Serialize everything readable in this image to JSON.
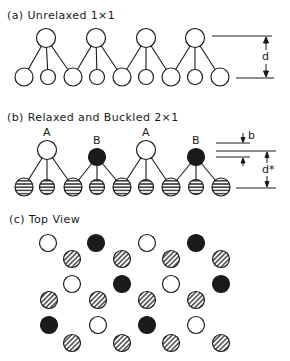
{
  "panels": {
    "a": {
      "title": "(a)  Unrelaxed  1×1",
      "dim_label": "d"
    },
    "b": {
      "title": "(b)  Relaxed and Buckled  2×1",
      "atom_labels": [
        "A",
        "B",
        "A",
        "B"
      ],
      "dim_label_b": "b",
      "dim_label_d": "d*"
    },
    "c": {
      "title": "(c)  Top View"
    }
  },
  "legend_semantics": {
    "open_circle": "A atom (up)",
    "filled_circle": "B atom (down)",
    "hatched_circle": "substrate atom"
  },
  "colors": {
    "ink": "#1a1a1a",
    "background": "#ffffff"
  }
}
